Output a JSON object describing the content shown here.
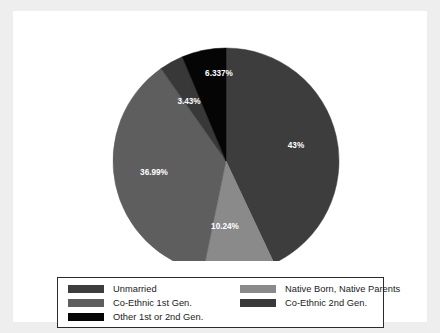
{
  "figure": {
    "background_color": "#eeeeee",
    "panel_color": "#ffffff"
  },
  "chart_data": {
    "type": "pie",
    "title": "",
    "subtitle": "",
    "xlabel": "",
    "ylabel": "",
    "grid": false,
    "legend_position": "bottom",
    "start_angle_deg": 90,
    "direction": "clockwise",
    "categories": [
      "Unmarried",
      "Native Born, Native Parents",
      "Co-Ethnic 1st Gen.",
      "Co-Ethnic 2nd Gen.",
      "Other 1st or 2nd Gen."
    ],
    "values": [
      43,
      10.24,
      36.99,
      3.43,
      6.337
    ],
    "data_labels": [
      "43%",
      "10.24%",
      "36.99%",
      "3.43%",
      "6.337%"
    ],
    "colors": [
      "#3d3d3d",
      "#8a8a8a",
      "#5e5e5e",
      "#383838",
      "#050505"
    ],
    "slices": [
      {
        "label": "Unmarried",
        "value": 43,
        "data_label": "43%",
        "color": "#3d3d3d",
        "label_x": 283,
        "label_y": 135
      },
      {
        "label": "Native Born, Native Parents",
        "value": 10.24,
        "data_label": "10.24%",
        "color": "#8a8a8a",
        "label_x": 212,
        "label_y": 216
      },
      {
        "label": "Co-Ethnic 1st Gen.",
        "value": 36.99,
        "data_label": "36.99%",
        "color": "#5e5e5e",
        "label_x": 141,
        "label_y": 162
      },
      {
        "label": "Co-Ethnic 2nd Gen.",
        "value": 3.43,
        "data_label": "3.43%",
        "color": "#383838",
        "label_x": 176,
        "label_y": 91
      },
      {
        "label": "Other 1st or 2nd Gen.",
        "value": 6.337,
        "data_label": "6.337%",
        "color": "#050505",
        "label_x": 206,
        "label_y": 63
      }
    ]
  },
  "legend": {
    "entries": [
      {
        "label": "Unmarried",
        "color": "#3d3d3d"
      },
      {
        "label": "Native Born, Native Parents",
        "color": "#8a8a8a"
      },
      {
        "label": "Co-Ethnic 1st Gen.",
        "color": "#5e5e5e"
      },
      {
        "label": "Co-Ethnic 2nd Gen.",
        "color": "#383838"
      },
      {
        "label": "Other 1st or 2nd Gen.",
        "color": "#050505"
      }
    ]
  }
}
